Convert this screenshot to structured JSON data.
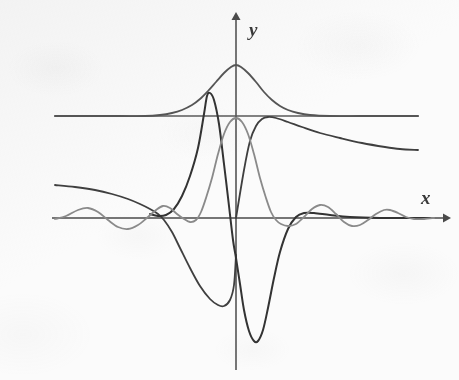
{
  "figure": {
    "kind": "math-plot",
    "background_color": "#fbfbfb",
    "axis_color": "#4a4a4a",
    "labels": {
      "y_axis": "y",
      "x_axis": "x"
    }
  },
  "chart_data": {
    "type": "line",
    "title": "",
    "subtitle": "",
    "xlabel": "x",
    "ylabel": "y",
    "grid": false,
    "legend": null,
    "axes": {
      "origin_px": [
        236,
        218
      ],
      "x_axis_y_px": 218,
      "y_axis_x_px": 236,
      "x_axis_start_px": 52,
      "x_axis_end_px": 447,
      "y_axis_top_px": 14,
      "y_axis_bottom_px": 370,
      "x_arrow": true,
      "y_arrow": true,
      "tick_labels_x": [],
      "tick_labels_y": [],
      "xlim_px": [
        52,
        447
      ],
      "ylim_px": [
        14,
        370
      ]
    },
    "series": [
      {
        "name": "horizontal-asymptote-line",
        "color": "#5a5a5a",
        "width": 1.7,
        "description": "flat horizontal line above the x-axis",
        "points": [
          [
            55,
            116
          ],
          [
            120,
            116
          ],
          [
            200,
            116
          ],
          [
            300,
            116
          ],
          [
            418,
            116
          ]
        ]
      },
      {
        "name": "bell-peak-curve",
        "color": "#555555",
        "width": 1.8,
        "description": "tall single-peak bell curve centered on the y-axis, decaying to the flat line level on both sides",
        "points": [
          [
            55,
            116
          ],
          [
            90,
            116
          ],
          [
            120,
            116
          ],
          [
            145,
            116
          ],
          [
            160,
            115
          ],
          [
            172,
            113
          ],
          [
            182,
            110
          ],
          [
            192,
            105
          ],
          [
            200,
            99
          ],
          [
            208,
            91
          ],
          [
            216,
            82
          ],
          [
            224,
            73
          ],
          [
            231,
            67
          ],
          [
            236,
            65
          ],
          [
            241,
            67
          ],
          [
            248,
            73
          ],
          [
            256,
            82
          ],
          [
            264,
            92
          ],
          [
            272,
            100
          ],
          [
            280,
            106
          ],
          [
            288,
            110
          ],
          [
            298,
            113
          ],
          [
            310,
            115
          ],
          [
            330,
            116
          ],
          [
            360,
            116
          ],
          [
            390,
            116
          ],
          [
            418,
            116
          ]
        ]
      },
      {
        "name": "decaying-curve",
        "color": "#3f3f3f",
        "width": 1.8,
        "description": "curve that rises steeply after the origin to a local max then slowly decays toward the right",
        "points": [
          [
            236,
            218
          ],
          [
            244,
            170
          ],
          [
            250,
            141
          ],
          [
            256,
            126
          ],
          [
            262,
            119
          ],
          [
            268,
            117
          ],
          [
            276,
            118
          ],
          [
            288,
            122
          ],
          [
            302,
            127
          ],
          [
            320,
            133
          ],
          [
            340,
            138
          ],
          [
            362,
            143
          ],
          [
            385,
            147
          ],
          [
            400,
            149
          ],
          [
            418,
            150
          ]
        ]
      },
      {
        "name": "declining-left-curve",
        "color": "#3f3f3f",
        "width": 1.8,
        "description": "curve entering at the left, slowly declining, crossing the x-axis near x=160 and plunging to a deep minimum near x=222",
        "points": [
          [
            55,
            185
          ],
          [
            75,
            187
          ],
          [
            95,
            190
          ],
          [
            112,
            194
          ],
          [
            128,
            199
          ],
          [
            140,
            204
          ],
          [
            150,
            209
          ],
          [
            158,
            214
          ],
          [
            164,
            220
          ],
          [
            172,
            232
          ],
          [
            180,
            248
          ],
          [
            190,
            268
          ],
          [
            200,
            286
          ],
          [
            210,
            299
          ],
          [
            218,
            305
          ],
          [
            224,
            306
          ],
          [
            230,
            300
          ],
          [
            234,
            285
          ],
          [
            236,
            255
          ]
        ]
      },
      {
        "name": "sharp-odd-curve",
        "color": "#333333",
        "width": 2.0,
        "description": "steep antisymmetric curve: from x-axis near x=150 rises to a local max near x=207, plunges through the origin to a deep minimum near x=256, then rises and flattens onto the x-axis to the right",
        "points": [
          [
            150,
            214
          ],
          [
            158,
            216
          ],
          [
            166,
            215
          ],
          [
            174,
            209
          ],
          [
            182,
            196
          ],
          [
            190,
            176
          ],
          [
            198,
            148
          ],
          [
            204,
            114
          ],
          [
            207,
            96
          ],
          [
            210,
            93
          ],
          [
            214,
            100
          ],
          [
            219,
            124
          ],
          [
            224,
            164
          ],
          [
            229,
            206
          ],
          [
            233,
            240
          ],
          [
            236,
            258
          ],
          [
            240,
            284
          ],
          [
            244,
            310
          ],
          [
            249,
            331
          ],
          [
            254,
            341
          ],
          [
            258,
            341
          ],
          [
            263,
            330
          ],
          [
            268,
            308
          ],
          [
            274,
            278
          ],
          [
            280,
            252
          ],
          [
            288,
            229
          ],
          [
            296,
            217
          ],
          [
            304,
            213
          ],
          [
            314,
            213
          ],
          [
            330,
            215
          ],
          [
            350,
            217
          ],
          [
            380,
            218
          ],
          [
            410,
            218
          ],
          [
            430,
            218
          ]
        ]
      },
      {
        "name": "sinc-oscillation-curve",
        "color": "#8a8a8a",
        "width": 1.8,
        "description": "low-amplitude oscillating sinc-like curve along the x-axis with a tall narrow central peak on the y-axis",
        "points": [
          [
            55,
            219
          ],
          [
            66,
            216
          ],
          [
            78,
            210
          ],
          [
            88,
            208
          ],
          [
            98,
            212
          ],
          [
            108,
            220
          ],
          [
            118,
            227
          ],
          [
            128,
            229
          ],
          [
            138,
            225
          ],
          [
            148,
            217
          ],
          [
            156,
            210
          ],
          [
            163,
            206
          ],
          [
            170,
            208
          ],
          [
            177,
            214
          ],
          [
            184,
            219
          ],
          [
            190,
            222
          ],
          [
            196,
            220
          ],
          [
            201,
            212
          ],
          [
            206,
            198
          ],
          [
            212,
            178
          ],
          [
            218,
            154
          ],
          [
            224,
            134
          ],
          [
            230,
            122
          ],
          [
            236,
            118
          ],
          [
            242,
            122
          ],
          [
            248,
            134
          ],
          [
            254,
            154
          ],
          [
            260,
            178
          ],
          [
            266,
            198
          ],
          [
            271,
            212
          ],
          [
            276,
            220
          ],
          [
            281,
            224
          ],
          [
            288,
            226
          ],
          [
            296,
            224
          ],
          [
            304,
            217
          ],
          [
            312,
            209
          ],
          [
            320,
            205
          ],
          [
            328,
            207
          ],
          [
            336,
            214
          ],
          [
            344,
            222
          ],
          [
            352,
            226
          ],
          [
            360,
            225
          ],
          [
            368,
            220
          ],
          [
            376,
            214
          ],
          [
            384,
            210
          ],
          [
            390,
            210
          ],
          [
            398,
            213
          ],
          [
            406,
            217
          ],
          [
            414,
            219
          ],
          [
            424,
            219
          ],
          [
            434,
            218
          ]
        ]
      }
    ]
  }
}
